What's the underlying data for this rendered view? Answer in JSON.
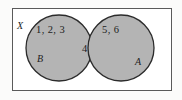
{
  "diagram": {
    "type": "venn-diagram",
    "universe_label": "X",
    "colors": {
      "circle_fill": "#b4b4b4",
      "circle_stroke": "#2b2b2b",
      "rect_stroke": "#5a5a5a",
      "rect_fill": "#ffffff",
      "page_background": "#fbfbfa",
      "text": "#1d1d1d"
    },
    "sets": [
      {
        "name": "B",
        "position": "left",
        "exclusive_elements": "1, 2, 3"
      },
      {
        "name": "A",
        "position": "right",
        "exclusive_elements": "5, 6"
      }
    ],
    "intersection": {
      "elements": "4"
    }
  }
}
